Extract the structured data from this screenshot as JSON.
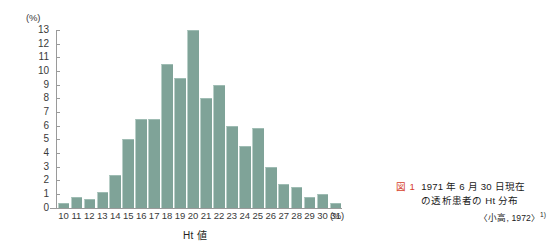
{
  "chart_data": {
    "type": "bar",
    "title": "",
    "xlabel": "Ht 値",
    "ylabel": "(%)",
    "x_unit": "(%)",
    "y_unit": "(%)",
    "categories": [
      "10",
      "11",
      "12",
      "13",
      "14",
      "15",
      "16",
      "17",
      "18",
      "19",
      "20",
      "21",
      "22",
      "23",
      "24",
      "25",
      "26",
      "27",
      "28",
      "29",
      "30",
      "31"
    ],
    "values": [
      0.3,
      0.8,
      0.6,
      1.1,
      2.4,
      5.0,
      6.5,
      6.5,
      10.5,
      9.5,
      13.0,
      8.0,
      9.0,
      6.0,
      4.5,
      5.8,
      3.0,
      1.7,
      1.5,
      0.8,
      1.0,
      0.3
    ],
    "ylim": [
      0,
      13
    ],
    "yticks": [
      "0",
      "1",
      "2",
      "3",
      "4",
      "5",
      "6",
      "7",
      "8",
      "9",
      "10",
      "11",
      "12",
      "13"
    ],
    "grid": false,
    "legend": "none",
    "bar_color": "#7fa398"
  },
  "caption": {
    "figure_tag": "図 1",
    "line1": "1971 年 6 月 30 日現在",
    "line2": "の透析患者の Ht 分布",
    "source": "〈小高, 1972〉",
    "source_ref": "1)",
    "tag_color": "#d6412b"
  }
}
